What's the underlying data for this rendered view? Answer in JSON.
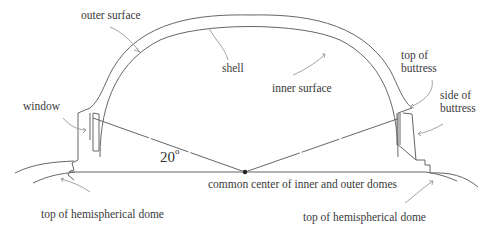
{
  "diagram": {
    "labels": {
      "outer_surface": "outer surface",
      "shell": "shell",
      "inner_surface": "inner surface",
      "top_of_buttress_line1": "top of",
      "top_of_buttress_line2": "buttress",
      "side_of_buttress_line1": "side of",
      "side_of_buttress_line2": "buttress",
      "window": "window",
      "common_center": "common center of inner and outer domes",
      "top_hemispherical_left": "top of hemispherical dome",
      "top_hemispherical_right": "top of hemispherical dome"
    },
    "angle": {
      "value": "20",
      "unit": "o"
    },
    "colors": {
      "line": "#555555",
      "arrow": "#8a8a8a",
      "text": "#3a3a3a",
      "center_dot": "#222222"
    }
  }
}
